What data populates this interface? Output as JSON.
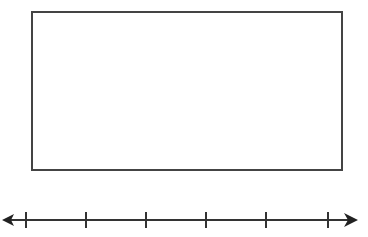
{
  "diagram": {
    "rectangle": {
      "label": "",
      "stroke": "#444444"
    },
    "number_line": {
      "tick_count": 6,
      "tick_labels": [],
      "arrows": "both",
      "stroke": "#333333"
    }
  }
}
